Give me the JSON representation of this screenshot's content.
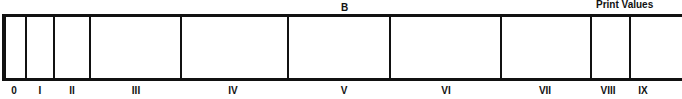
{
  "diagram": {
    "heading": "B",
    "corner_label": "Print Values",
    "segments": [
      {
        "label": "0",
        "left": 2,
        "right": 26,
        "center": 14
      },
      {
        "label": "I",
        "left": 26,
        "right": 54,
        "center": 40
      },
      {
        "label": "II",
        "left": 54,
        "right": 90,
        "center": 72
      },
      {
        "label": "III",
        "left": 90,
        "right": 181,
        "center": 136
      },
      {
        "label": "IV",
        "left": 181,
        "right": 288,
        "center": 233
      },
      {
        "label": "V",
        "left": 288,
        "right": 390,
        "center": 344
      },
      {
        "label": "VI",
        "left": 390,
        "right": 501,
        "center": 446
      },
      {
        "label": "VII",
        "left": 501,
        "right": 591,
        "center": 545
      },
      {
        "label": "VIII",
        "left": 591,
        "right": 630,
        "center": 608
      },
      {
        "label": "IX",
        "left": 630,
        "right": 656,
        "center": 643
      }
    ],
    "divider_x": [
      26,
      54,
      90,
      181,
      288,
      390,
      501,
      591,
      630
    ],
    "line_color": "#111111",
    "background": "#ffffff"
  }
}
